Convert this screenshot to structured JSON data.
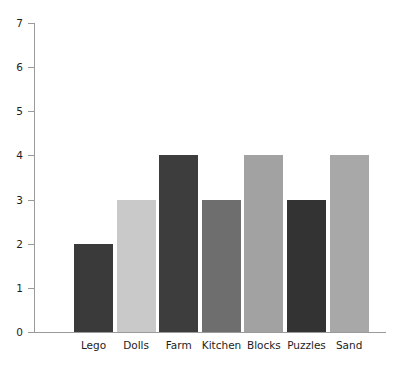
{
  "chart_data": {
    "type": "bar",
    "title": "",
    "xlabel": "",
    "ylabel": "",
    "categories": [
      "Lego",
      "Dolls",
      "Farm",
      "Kitchen",
      "Blocks",
      "Puzzles",
      "Sand"
    ],
    "values": [
      2,
      3,
      4,
      3,
      4,
      3,
      4
    ],
    "bar_colors": [
      "#3a3a3a",
      "#c9c9c9",
      "#3d3d3d",
      "#6e6e6e",
      "#a2a2a2",
      "#333333",
      "#a8a8a8"
    ],
    "ylim": [
      0,
      7
    ],
    "yticks": [
      0,
      1,
      2,
      3,
      4,
      5,
      6,
      7
    ],
    "ytick_labels": [
      "0",
      "1",
      "2",
      "3",
      "4",
      "5",
      "6",
      "7"
    ],
    "grid": false,
    "legend": null,
    "axis_color": "#9a9a9a",
    "background": "#ffffff"
  }
}
